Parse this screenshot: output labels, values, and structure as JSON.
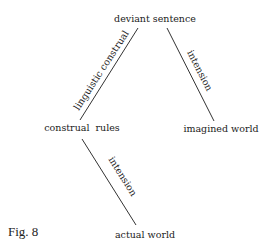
{
  "figure_label": "Fig. 8",
  "nodes": {
    "deviant_sentence": "deviant sentence",
    "construal_rules": "construal  rules",
    "imagined_world": "imagined world",
    "actual_world": "actual world"
  },
  "edges": {
    "left": {
      "from": "construal rules",
      "to": "deviant sentence",
      "label": "linguistic construal"
    },
    "right": {
      "from": "deviant sentence",
      "to": "imagined world",
      "label": "intension"
    },
    "lower": {
      "from": "construal rules",
      "to": "actual world",
      "label": "intension"
    }
  }
}
